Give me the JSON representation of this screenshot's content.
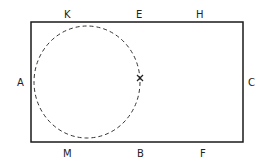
{
  "diagram": {
    "rectangle": {
      "x": 31,
      "y": 22,
      "width": 212,
      "height": 120,
      "stroke": "#1a1a1a"
    },
    "circle": {
      "cx": 87,
      "cy": 82,
      "rx": 53,
      "ry": 56,
      "style": "dashed",
      "stroke": "#333333"
    },
    "marker": {
      "label": "X",
      "x": 140,
      "y": 78
    },
    "labels": {
      "K": {
        "text": "K",
        "x": 67,
        "y": 18
      },
      "E": {
        "text": "E",
        "x": 139,
        "y": 18
      },
      "H": {
        "text": "H",
        "x": 199,
        "y": 18
      },
      "A": {
        "text": "A",
        "x": 21,
        "y": 86
      },
      "C": {
        "text": "C",
        "x": 251,
        "y": 86
      },
      "M": {
        "text": "M",
        "x": 67,
        "y": 157
      },
      "B": {
        "text": "B",
        "x": 140,
        "y": 157
      },
      "F": {
        "text": "F",
        "x": 203,
        "y": 157
      }
    }
  }
}
